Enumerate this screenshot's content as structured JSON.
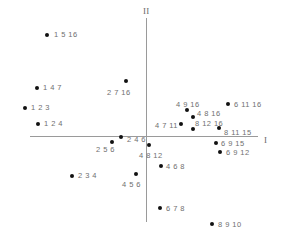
{
  "chart_data": {
    "type": "scatter",
    "title": "",
    "xlabel": "I",
    "ylabel": "II",
    "grid": false,
    "legend": null,
    "axes": {
      "horizontal_label": "I",
      "vertical_label": "II",
      "origin_px": {
        "x": 146,
        "y": 136
      }
    },
    "points": [
      {
        "label": "1 5 16",
        "px": 47,
        "py": 35,
        "lx": 54,
        "ly": 31,
        "anchor": "right"
      },
      {
        "label": "1 4 7",
        "px": 37,
        "py": 88,
        "lx": 43,
        "ly": 84,
        "anchor": "right"
      },
      {
        "label": "1 2 3",
        "px": 25,
        "py": 108,
        "lx": 31,
        "ly": 104,
        "anchor": "right"
      },
      {
        "label": "1 2 4",
        "px": 38,
        "py": 124,
        "lx": 44,
        "ly": 120,
        "anchor": "right"
      },
      {
        "label": "2 7 16",
        "px": 126,
        "py": 81,
        "lx": 107,
        "ly": 89,
        "anchor": "below"
      },
      {
        "label": "2 4 6",
        "px": 121,
        "py": 137,
        "lx": 127,
        "ly": 136,
        "anchor": "right"
      },
      {
        "label": "2 5 6",
        "px": 112,
        "py": 142,
        "lx": 96,
        "ly": 146,
        "anchor": "below"
      },
      {
        "label": "2 3 4",
        "px": 72,
        "py": 176,
        "lx": 78,
        "ly": 172,
        "anchor": "right"
      },
      {
        "label": "4 5 6",
        "px": 136,
        "py": 174,
        "lx": 122,
        "ly": 181,
        "anchor": "below"
      },
      {
        "label": "4 9 16",
        "px": 187,
        "py": 110,
        "lx": 176,
        "ly": 101,
        "anchor": "above"
      },
      {
        "label": "4 8 16",
        "px": 193,
        "py": 117,
        "lx": 197,
        "ly": 110,
        "anchor": "upright"
      },
      {
        "label": "4 7 11",
        "px": 181,
        "py": 124,
        "lx": 155,
        "ly": 122,
        "anchor": "left"
      },
      {
        "label": "8 12 16",
        "px": 193,
        "py": 129,
        "lx": 195,
        "ly": 120,
        "anchor": "upright"
      },
      {
        "label": "6 11 16",
        "px": 228,
        "py": 104,
        "lx": 234,
        "ly": 101,
        "anchor": "right"
      },
      {
        "label": "8 11 15",
        "px": 219,
        "py": 128,
        "lx": 224,
        "ly": 129,
        "anchor": "right"
      },
      {
        "label": "4 8 12",
        "px": 149,
        "py": 145,
        "lx": 139,
        "ly": 152,
        "anchor": "below"
      },
      {
        "label": "6 9 15",
        "px": 216,
        "py": 143,
        "lx": 221,
        "ly": 140,
        "anchor": "right"
      },
      {
        "label": "6 9 12",
        "px": 220,
        "py": 152,
        "lx": 226,
        "ly": 149,
        "anchor": "right"
      },
      {
        "label": "4 6 8",
        "px": 161,
        "py": 166,
        "lx": 166,
        "ly": 163,
        "anchor": "right"
      },
      {
        "label": "6 7 8",
        "px": 160,
        "py": 208,
        "lx": 166,
        "ly": 205,
        "anchor": "right"
      },
      {
        "label": "8 9 10",
        "px": 212,
        "py": 224,
        "lx": 218,
        "ly": 221,
        "anchor": "right"
      }
    ]
  },
  "colors": {
    "point": "#111111",
    "label": "#6f6f6f",
    "axis": "#9a9a9a",
    "background": "#ffffff"
  }
}
